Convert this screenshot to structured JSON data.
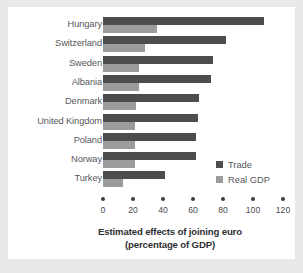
{
  "chart_data": {
    "type": "bar",
    "orientation": "horizontal",
    "grouped": "side-by-side",
    "title": "Estimated effects of joining euro (percentage of GDP)",
    "title_line1": "Estimated effects of joining euro",
    "title_line2": "(percentage of GDP)",
    "xlabel": "Estimated effects of joining euro (percentage of GDP)",
    "ylabel": "",
    "xlim": [
      0,
      120
    ],
    "xticks": [
      0,
      20,
      40,
      60,
      80,
      100,
      120
    ],
    "xtick_labels": [
      "0",
      "20",
      "40",
      "60",
      "80",
      "100",
      "120"
    ],
    "grid": false,
    "legend_position": "center-right",
    "categories": [
      "Hungary",
      "Switzerland",
      "Sweden",
      "Albania",
      "Denmark",
      "United Kingdom",
      "Poland",
      "Norway",
      "Turkey"
    ],
    "series": [
      {
        "name": "Trade",
        "color": "#4d4d50",
        "values": [
          107,
          82,
          73,
          72,
          64,
          63,
          62,
          62,
          41
        ]
      },
      {
        "name": "Real GDP",
        "color": "#9c9c9e",
        "values": [
          36,
          28,
          24,
          24,
          22,
          21,
          21,
          21,
          13
        ]
      }
    ]
  },
  "legend": {
    "items": [
      {
        "label": "Trade",
        "color": "#4d4d50"
      },
      {
        "label": "Real GDP",
        "color": "#9c9c9e"
      }
    ]
  },
  "colors": {
    "background": "#e9e9ea",
    "plate": "#ffffff",
    "trade": "#4d4d50",
    "real_gdp": "#9c9c9e",
    "label_text": "#58585b",
    "title_text": "#303033"
  }
}
